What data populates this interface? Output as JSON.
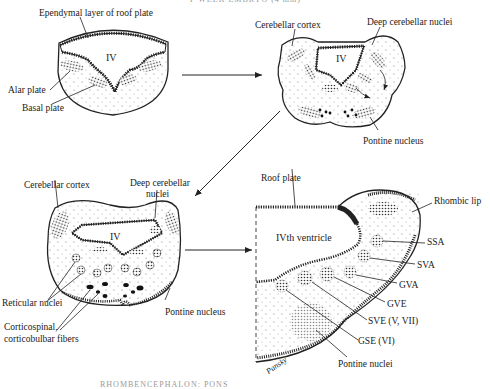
{
  "header_cut": "F WEEK EMBRYO (4 mm)",
  "footer_cut": "RHOMBENCEPHALON: PONS",
  "panel1": {
    "ventricle": "IV",
    "labels": {
      "roof": "Ependymal layer of roof plate",
      "alar": "Alar plate",
      "basal": "Basal plate"
    }
  },
  "panel2": {
    "ventricle": "IV",
    "labels": {
      "cortex": "Cerebellar cortex",
      "deep": "Deep cerebellar nuclei",
      "pontine": "Pontine nucleus"
    }
  },
  "panel3": {
    "ventricle": "IV",
    "labels": {
      "cortex": "Cerebellar cortex",
      "deep1": "Deep cerebellar",
      "deep2": "nuclei",
      "reticular": "Reticular nuclei",
      "cortico1": "Corticospinal,",
      "cortico2": "corticobulbar fibers",
      "pontine": "Pontine nucleus"
    }
  },
  "panel4": {
    "ventricle": "IVth ventricle",
    "labels": {
      "roof": "Roof plate",
      "rhombic": "Rhombic lip",
      "ssa": "SSA",
      "sva": "SVA",
      "gva": "GVA",
      "gve": "GVE",
      "sve": "SVE (V, VII)",
      "gse": "GSE (VI)",
      "pontine": "Pontine nuclei"
    },
    "signature": "Pansky"
  }
}
